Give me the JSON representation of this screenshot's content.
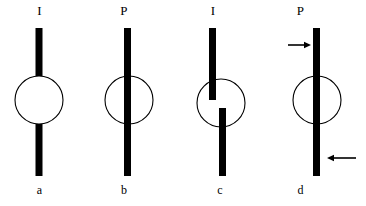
{
  "figure": {
    "background_color": "#ffffff",
    "bar_color": "#000000",
    "circle_stroke_color": "#000000",
    "arrow_color": "#000000",
    "width": 366,
    "height": 206
  },
  "panels": [
    {
      "id": "a",
      "top_label": "I",
      "bottom_label": "a",
      "description": "vertical bar interrupted by empty circle",
      "circle": {
        "cx": 39,
        "cy": 100,
        "r": 24
      },
      "bars": [
        {
          "name": "upper-bar",
          "x": 35.5,
          "y": 28,
          "width": 7,
          "height": 48
        },
        {
          "name": "lower-bar",
          "x": 35.5,
          "y": 124,
          "width": 7,
          "height": 52
        }
      ],
      "arrows": []
    },
    {
      "id": "b",
      "top_label": "P",
      "bottom_label": "b",
      "description": "continuous vertical bar passing through circle",
      "circle": {
        "cx": 129,
        "cy": 100,
        "r": 24
      },
      "bars": [
        {
          "name": "through-bar",
          "x": 124,
          "y": 28,
          "width": 7,
          "height": 148
        }
      ],
      "arrows": []
    },
    {
      "id": "c",
      "top_label": "I",
      "bottom_label": "c",
      "description": "bar broken into two laterally offset segments inside the circle",
      "circle": {
        "cx": 221,
        "cy": 103,
        "r": 24
      },
      "bars": [
        {
          "name": "upper-bar",
          "x": 209,
          "y": 28,
          "width": 7,
          "height": 72
        },
        {
          "name": "lower-bar",
          "x": 219,
          "y": 108,
          "width": 7,
          "height": 68
        }
      ],
      "arrows": []
    },
    {
      "id": "d",
      "top_label": "P",
      "bottom_label": "d",
      "description": "continuous bar through circle with opposing force couple arrows",
      "circle": {
        "cx": 317,
        "cy": 100,
        "r": 24
      },
      "bars": [
        {
          "name": "through-bar",
          "x": 313,
          "y": 28,
          "width": 7,
          "height": 148
        }
      ],
      "arrows": [
        {
          "name": "upper-force-arrow",
          "direction": "right",
          "x1": 288,
          "x2": 311,
          "y": 45
        },
        {
          "name": "lower-force-arrow",
          "direction": "left",
          "x1": 356,
          "x2": 322,
          "y": 158
        }
      ]
    }
  ]
}
